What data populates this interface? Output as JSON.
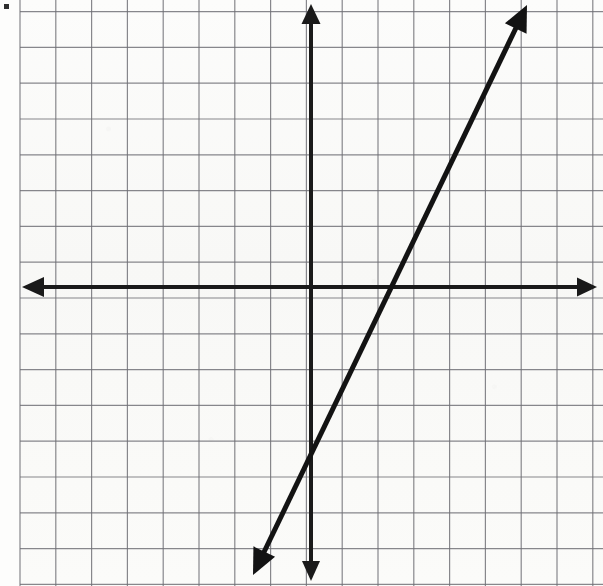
{
  "image": {
    "kind": "scanned-graph-paper-worksheet",
    "width": 603,
    "height": 586,
    "background_color": "#fbfbfa",
    "ink_color": "#1a1a1a",
    "grid_color": "#6e6e74"
  },
  "grid": {
    "cell_size_px": 35.8,
    "left_margin_px": 20,
    "first_vertical_line_px": 20,
    "first_horizontal_line_px": 11.6,
    "vertical_line_count": 17,
    "horizontal_line_count": 17,
    "line_width_px": 1.2,
    "color": "#6e6e74"
  },
  "axes": {
    "x_axis": {
      "label": "x-axis",
      "orientation": "horizontal",
      "pixel_y": 287,
      "from_px": 22,
      "to_px": 597,
      "stroke_width": 4,
      "arrow_left": true,
      "arrow_right": true
    },
    "y_axis": {
      "label": "y-axis",
      "orientation": "vertical",
      "pixel_x": 311,
      "from_px": 4,
      "to_px": 581,
      "stroke_width": 4,
      "arrow_up": true,
      "arrow_down": true
    },
    "origin_px": {
      "x": 311,
      "y": 287
    }
  },
  "chart_data": {
    "type": "line",
    "title": "",
    "xlabel": "x",
    "ylabel": "y",
    "grid": true,
    "legend": null,
    "xlim": [
      -8.1,
      8.0
    ],
    "ylim": [
      -8.4,
      7.7
    ],
    "x_ticks": [
      -8,
      -7,
      -6,
      -5,
      -4,
      -3,
      -2,
      -1,
      0,
      1,
      2,
      3,
      4,
      5,
      6,
      7,
      8
    ],
    "y_ticks": [
      -8,
      -7,
      -6,
      -5,
      -4,
      -3,
      -2,
      -1,
      0,
      1,
      2,
      3,
      4,
      5,
      6,
      7
    ],
    "tick_labels_shown": false,
    "series": [
      {
        "name": "plotted-line",
        "equation": "y = 2x - 4",
        "slope": 2,
        "y_intercept": -4,
        "x_intercept": 2,
        "arrow_both_ends": true,
        "stroke_width": 5,
        "color": "#131313",
        "points": [
          {
            "x": -0.4,
            "y": -4.8
          },
          {
            "x": 0,
            "y": -4
          },
          {
            "x": 2,
            "y": 0
          },
          {
            "x": 4,
            "y": 4
          },
          {
            "x": 6.05,
            "y": 8.1
          }
        ],
        "pixel_start": {
          "x": 253,
          "y": 575
        },
        "pixel_end": {
          "x": 527,
          "y": 5
        }
      }
    ]
  },
  "artifacts": {
    "scan_speck": {
      "x": 4,
      "y": 4,
      "width": 5,
      "height": 5,
      "color": "#2f2f2f"
    }
  }
}
